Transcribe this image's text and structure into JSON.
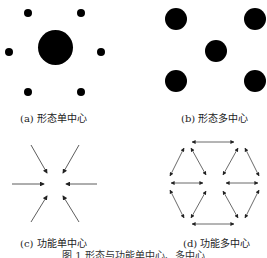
{
  "panels": {
    "a": {
      "label": "(a) 形态单中心",
      "type": "morphological-monocentric"
    },
    "b": {
      "label": "(b) 形态多中心",
      "type": "morphological-polycentric"
    },
    "c": {
      "label": "(c) 功能单中心",
      "type": "functional-monocentric"
    },
    "d": {
      "label": "(d) 功能多中心",
      "type": "functional-polycentric"
    }
  },
  "figure_caption": "图 1  形态与功能单中心、多中心",
  "colors": {
    "ink": "#000000",
    "background": "#ffffff"
  }
}
